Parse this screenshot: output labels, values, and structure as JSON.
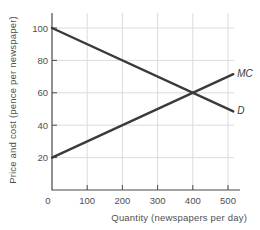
{
  "chart_data": {
    "type": "line",
    "title": "",
    "xlabel": "Quantity (newspapers per day)",
    "ylabel": "Price and cost (pence per newspaper)",
    "xlim": [
      0,
      500
    ],
    "ylim": [
      0,
      100
    ],
    "x_ticks": [
      0,
      100,
      200,
      300,
      400,
      500
    ],
    "y_ticks": [
      0,
      20,
      40,
      60,
      80,
      100
    ],
    "grid": true,
    "legend_position": "line-end-labels",
    "series": [
      {
        "name": "D",
        "label": "D",
        "points": [
          [
            0,
            100
          ],
          [
            500,
            50
          ]
        ]
      },
      {
        "name": "MC",
        "label": "MC",
        "points": [
          [
            0,
            20
          ],
          [
            500,
            70
          ]
        ]
      }
    ],
    "intersection": {
      "x": 400,
      "y": 60
    },
    "x_extend": 515,
    "colors": {
      "line": "#3a3a3a",
      "axis": "#4a4a4a",
      "grid": "#dcdcdc",
      "text": "#4f4f4f",
      "background": "#ffffff"
    }
  }
}
